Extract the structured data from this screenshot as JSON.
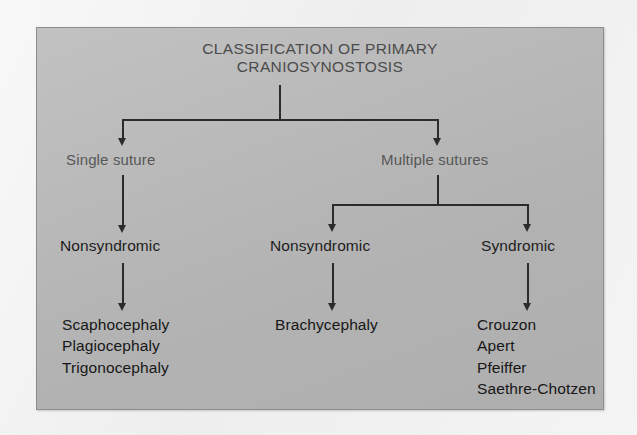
{
  "diagram": {
    "title_line1": "CLASSIFICATION OF PRIMARY",
    "title_line2": "CRANIOSYNOSTOSIS",
    "level2": {
      "left": "Single suture",
      "right": "Multiple sutures"
    },
    "level3": {
      "left": "Nonsyndromic",
      "middle": "Nonsyndromic",
      "right": "Syndromic"
    },
    "leaves": {
      "left": {
        "item1": "Scaphocephaly",
        "item2": "Plagiocephaly",
        "item3": "Trigonocephaly"
      },
      "middle": {
        "item1": "Brachycephaly"
      },
      "right": {
        "item1": "Crouzon",
        "item2": "Apert",
        "item3": "Pfeiffer",
        "item4": "Saethre-Chotzen"
      }
    }
  },
  "colors": {
    "panel_background": "#b9b9b9",
    "panel_border": "#8d8d8d",
    "page_background": "#f0f0f0",
    "title_text": "#4b4b4b",
    "level2_text": "#575757",
    "node_text": "#1d1d1d",
    "connector": "#2b2b2b"
  }
}
